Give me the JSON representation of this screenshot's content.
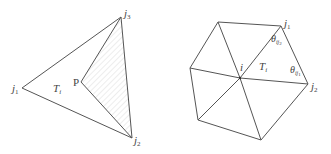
{
  "figures": [
    {
      "id": "left",
      "description": "Triangle T_i with vertices j1, j2, j3 and interior point P; shaded (hatched) region P-j3-j2",
      "vertices": {
        "j1": [
          22,
          88
        ],
        "j3": [
          121,
          17
        ],
        "j2": [
          132,
          138
        ],
        "P": [
          81,
          82
        ]
      },
      "labels": {
        "j1": "j",
        "j1_sub": "1",
        "j2": "j",
        "j2_sub": "2",
        "j3": "j",
        "j3_sub": "3",
        "P": "P",
        "T": "T",
        "T_sub": "i"
      },
      "hatch_color": "#dddddd",
      "line_color": "#555555"
    },
    {
      "id": "right",
      "description": "Hexagonal one-ring of triangles around vertex i with triangle T_i = (i, j1, j2) and angles theta",
      "vertices": {
        "i": [
          240,
          78
        ],
        "j1": [
          281,
          26
        ],
        "j2": [
          308,
          84
        ],
        "top_left": [
          218,
          22
        ],
        "left": [
          190,
          68
        ],
        "bottom_left": [
          198,
          120
        ],
        "bottom": [
          261,
          140
        ]
      },
      "labels": {
        "i": "i",
        "j1": "j",
        "j1_sub": "1",
        "j2": "j",
        "j2_sub": "2",
        "T": "T",
        "T_sub": "i",
        "theta1": "θ",
        "theta1_sub": "ij",
        "theta1_subsub": "2",
        "theta2": "θ",
        "theta2_sub": "ij",
        "theta2_subsub": "1"
      },
      "line_color": "#555555"
    }
  ]
}
